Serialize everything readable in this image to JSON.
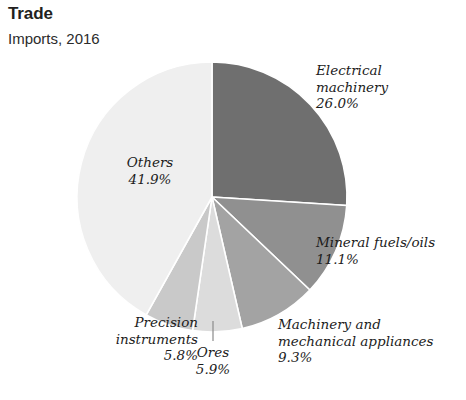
{
  "header": {
    "title": "Trade",
    "subtitle": "Imports, 2016"
  },
  "chart_data": {
    "type": "pie",
    "title": "Trade",
    "subtitle": "Imports, 2016",
    "xlabel": "",
    "ylabel": "",
    "unit": "%",
    "legend_position": "callout-labels",
    "grid": false,
    "start_angle_deg": 0,
    "direction": "clockwise",
    "categories": [
      "Electrical machinery",
      "Mineral fuels/oils",
      "Machinery and mechanical appliances",
      "Ores",
      "Precision instruments",
      "Others"
    ],
    "values": [
      26.0,
      11.1,
      9.3,
      5.9,
      5.8,
      41.9
    ],
    "slices": [
      {
        "name": "Electrical machinery",
        "label_line1": "Electrical",
        "label_line2": "machinery",
        "value_text": "26.0%",
        "value": 26.0,
        "color": "#6f6f6f"
      },
      {
        "name": "Mineral fuels/oils",
        "label_line1": "Mineral fuels/oils",
        "label_line2": "",
        "value_text": "11.1%",
        "value": 11.1,
        "color": "#909090"
      },
      {
        "name": "Machinery and mechanical appliances",
        "label_line1": "Machinery and",
        "label_line2": "mechanical appliances",
        "value_text": "9.3%",
        "value": 9.3,
        "color": "#a3a3a3"
      },
      {
        "name": "Ores",
        "label_line1": "Ores",
        "label_line2": "",
        "value_text": "5.9%",
        "value": 5.9,
        "color": "#dcdcdc"
      },
      {
        "name": "Precision instruments",
        "label_line1": "Precision",
        "label_line2": "instruments",
        "value_text": "5.8%",
        "value": 5.8,
        "color": "#c9c9c9"
      },
      {
        "name": "Others",
        "label_line1": "Others",
        "label_line2": "",
        "value_text": "41.9%",
        "value": 41.9,
        "color": "#efefef"
      }
    ]
  },
  "labels": {
    "electrical_machinery": "Electrical\nmachinery\n26.0%",
    "mineral_fuels": "Mineral fuels/oils\n11.1%",
    "machinery_appliances": "Machinery and\nmechanical appliances\n9.3%",
    "ores": "Ores\n5.9%",
    "precision_instruments": "Precision\ninstruments\n5.8%",
    "others": "Others\n41.9%"
  },
  "colors": {
    "background": "#ffffff",
    "text": "#231f20",
    "slice_separator": "#ffffff",
    "leader_line": "#8a8a8a"
  }
}
